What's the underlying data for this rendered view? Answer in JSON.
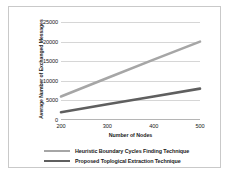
{
  "chart_data": {
    "type": "line",
    "title": "",
    "xlabel": "Number of Nodes",
    "ylabel": "Average Number of Exchanged Messages",
    "x": [
      200,
      300,
      400,
      500
    ],
    "xtick_labels": [
      "200",
      "300",
      "400",
      "500"
    ],
    "ytick_labels": [
      "0",
      "5000",
      "10000",
      "15000",
      "20000",
      "25000"
    ],
    "yticks": [
      0,
      5000,
      10000,
      15000,
      20000,
      25000
    ],
    "ylim": [
      0,
      25000
    ],
    "xlim": [
      200,
      500
    ],
    "grid": "horizontal",
    "legend_position": "bottom-center",
    "series": [
      {
        "name": "Heuristic Boundary Cycles Finding Technique",
        "color": "#a6a6a6",
        "values": [
          6000,
          10700,
          15400,
          20000
        ]
      },
      {
        "name": "Proposed Toplogical Extraction Technique",
        "color": "#5f5f5f",
        "values": [
          2000,
          4000,
          6000,
          8000
        ]
      }
    ]
  },
  "axes": {
    "y_title": "Average Number of Exchanged Messages",
    "x_title": "Number of Nodes"
  },
  "legend": {
    "items": [
      {
        "label": "Heuristic Boundary Cycles Finding Technique"
      },
      {
        "label": "Proposed Toplogical Extraction Technique"
      }
    ]
  }
}
